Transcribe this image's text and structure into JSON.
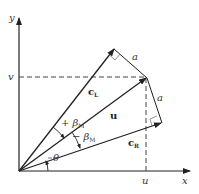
{
  "diagram": {
    "axes": {
      "x_label": "x",
      "y_label": "y"
    },
    "guides": {
      "u_label": "u",
      "v_label": "v"
    },
    "vectors": [
      {
        "id": "c_L",
        "label": "c",
        "subscript": "L"
      },
      {
        "id": "u",
        "label": "u",
        "subscript": ""
      },
      {
        "id": "c_R",
        "label": "c",
        "subscript": "R"
      }
    ],
    "segments": [
      {
        "id": "a_upper",
        "label": "a"
      },
      {
        "id": "a_lower",
        "label": "a"
      }
    ],
    "angles": [
      {
        "id": "plus_beta",
        "label": "+ β",
        "subscript": "M"
      },
      {
        "id": "minus_beta",
        "label": "− β",
        "subscript": "M"
      },
      {
        "id": "theta",
        "label": "θ"
      }
    ],
    "colors": {
      "line": "#222222",
      "dash": "#444444",
      "background": "#ffffff"
    }
  }
}
